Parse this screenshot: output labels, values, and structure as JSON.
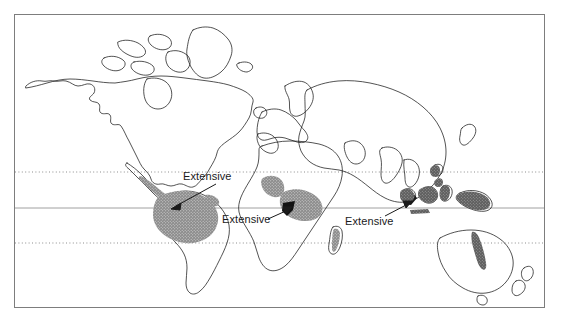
{
  "figure": {
    "type": "world-map",
    "background_color": "#ffffff",
    "outline_color": "#1a1a1a",
    "shade_color_primary": "#8a8a8a",
    "shade_color_dark": "#5a5a5a",
    "shade_color_darkest": "#111111",
    "border": {
      "color": "#7d7d7d",
      "x": 14,
      "y": 14,
      "width": 531,
      "height": 294
    }
  },
  "graticule": {
    "lines": [
      {
        "name": "tropic-of-cancer",
        "style": "dotted",
        "y": 172
      },
      {
        "name": "equator",
        "style": "solid",
        "y": 208
      },
      {
        "name": "tropic-of-capricorn",
        "style": "dotted",
        "y": 243
      }
    ],
    "dotted_color": "#8d8d8d",
    "solid_color": "#a0a0a0"
  },
  "annotations": [
    {
      "id": "amazon",
      "label": "Extensive",
      "text_x": 183,
      "text_y": 170,
      "arrow_from": [
        216,
        184
      ],
      "arrow_to": [
        172,
        208
      ]
    },
    {
      "id": "congo",
      "label": "Extensive",
      "text_x": 222,
      "text_y": 213,
      "arrow_from": [
        270,
        219
      ],
      "arrow_to": [
        288,
        208
      ]
    },
    {
      "id": "seasia",
      "label": "Extensive",
      "text_x": 345,
      "text_y": 215,
      "arrow_from": [
        385,
        216
      ],
      "arrow_to": [
        410,
        203
      ]
    }
  ],
  "regions": [
    {
      "name": "central-america-caribbean-coast",
      "shade": "primary"
    },
    {
      "name": "amazon-basin",
      "shade": "primary"
    },
    {
      "name": "west-africa-guinea-coast",
      "shade": "primary"
    },
    {
      "name": "congo-basin",
      "shade": "primary"
    },
    {
      "name": "madagascar-east-coast",
      "shade": "primary"
    },
    {
      "name": "malay-peninsula",
      "shade": "dark"
    },
    {
      "name": "sumatra",
      "shade": "dark"
    },
    {
      "name": "borneo",
      "shade": "dark"
    },
    {
      "name": "sulawesi",
      "shade": "dark"
    },
    {
      "name": "new-guinea",
      "shade": "dark"
    },
    {
      "name": "philippines",
      "shade": "dark"
    },
    {
      "name": "queensland-east-coast",
      "shade": "dark"
    }
  ]
}
